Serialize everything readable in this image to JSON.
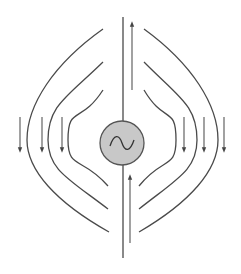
{
  "diagram": {
    "title": "",
    "colors": {
      "background": "#ffffff",
      "line": "#4a4a4a",
      "arrow": "#555555",
      "source_fill": "#c8c8c8",
      "source_stroke": "#555555"
    },
    "source": {
      "symbol": "ac-sine-icon",
      "cx": 122,
      "cy": 143,
      "r": 22
    },
    "conductor": {
      "top": {
        "x": 123,
        "y1": 17,
        "y2": 121
      },
      "bottom": {
        "x": 123,
        "y1": 165,
        "y2": 258
      }
    },
    "current_arrows": [
      {
        "x": 132,
        "y_start": 90,
        "y_end": 24,
        "direction": "up"
      },
      {
        "x": 130,
        "y_start": 243,
        "y_end": 177,
        "direction": "up"
      }
    ],
    "field_lines_left": [
      {
        "start": [
          103,
          29
        ],
        "apex_x": 27,
        "end": [
          109,
          232
        ]
      },
      {
        "start": [
          103,
          62
        ],
        "apex_x": 48,
        "end": [
          108,
          209
        ]
      },
      {
        "start": [
          103,
          90
        ],
        "apex_x": 68,
        "end": [
          108,
          186
        ]
      }
    ],
    "field_lines_right": [
      {
        "start": [
          144,
          29
        ],
        "apex_x": 218,
        "end": [
          139,
          232
        ]
      },
      {
        "start": [
          144,
          62
        ],
        "apex_x": 197,
        "end": [
          139,
          209
        ]
      },
      {
        "start": [
          144,
          90
        ],
        "apex_x": 176,
        "end": [
          139,
          186
        ]
      }
    ],
    "field_arrows": [
      {
        "x": 20,
        "y_start": 117,
        "y_end": 150,
        "direction": "down"
      },
      {
        "x": 42,
        "y_start": 117,
        "y_end": 150,
        "direction": "down"
      },
      {
        "x": 62,
        "y_start": 117,
        "y_end": 150,
        "direction": "down"
      },
      {
        "x": 184,
        "y_start": 117,
        "y_end": 150,
        "direction": "down"
      },
      {
        "x": 204,
        "y_start": 117,
        "y_end": 150,
        "direction": "down"
      },
      {
        "x": 224,
        "y_start": 117,
        "y_end": 150,
        "direction": "down"
      }
    ]
  }
}
